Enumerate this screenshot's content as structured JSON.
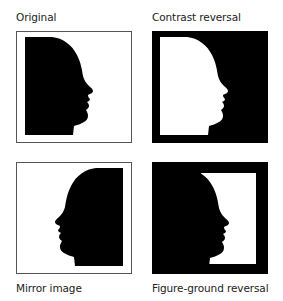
{
  "panels": [
    {
      "id": "original",
      "label": "Original",
      "background": "#ffffff",
      "figure": "#000000",
      "mirrored": false
    },
    {
      "id": "contrast-reversal",
      "label": "Contrast reversal",
      "background": "#000000",
      "figure": "#ffffff",
      "mirrored": false
    },
    {
      "id": "mirror-image",
      "label": "Mirror image",
      "background": "#ffffff",
      "figure": "#000000",
      "mirrored": true
    },
    {
      "id": "figure-ground-reversal",
      "label": "Figure-ground reversal",
      "background": "#000000",
      "figure": "#ffffff",
      "mirrored": false
    }
  ],
  "colors": {
    "border": "#555555",
    "text": "#222222"
  }
}
